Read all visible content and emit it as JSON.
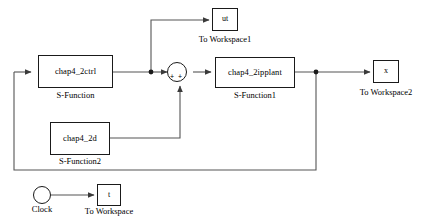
{
  "diagram": {
    "line_color": "#555555",
    "border_color": "#1a1a1a",
    "background": "#ffffff"
  },
  "blocks": {
    "controller": {
      "name": "chap4_2ctrl",
      "caption": "S-Function"
    },
    "plant": {
      "name": "chap4_2ipplant",
      "caption": "S-Function1"
    },
    "disturbance": {
      "name": "chap4_2d",
      "caption": "S-Function2"
    },
    "sum": {
      "input_left_sign": "+",
      "input_bottom_sign": "+"
    },
    "to_workspace_ut": {
      "name": "ut",
      "caption": "To Workspace1"
    },
    "to_workspace_x": {
      "name": "x",
      "caption": "To Workspace2"
    },
    "to_workspace_t": {
      "name": "t",
      "caption": "To Workspace"
    },
    "clock": {
      "caption": "Clock"
    }
  }
}
